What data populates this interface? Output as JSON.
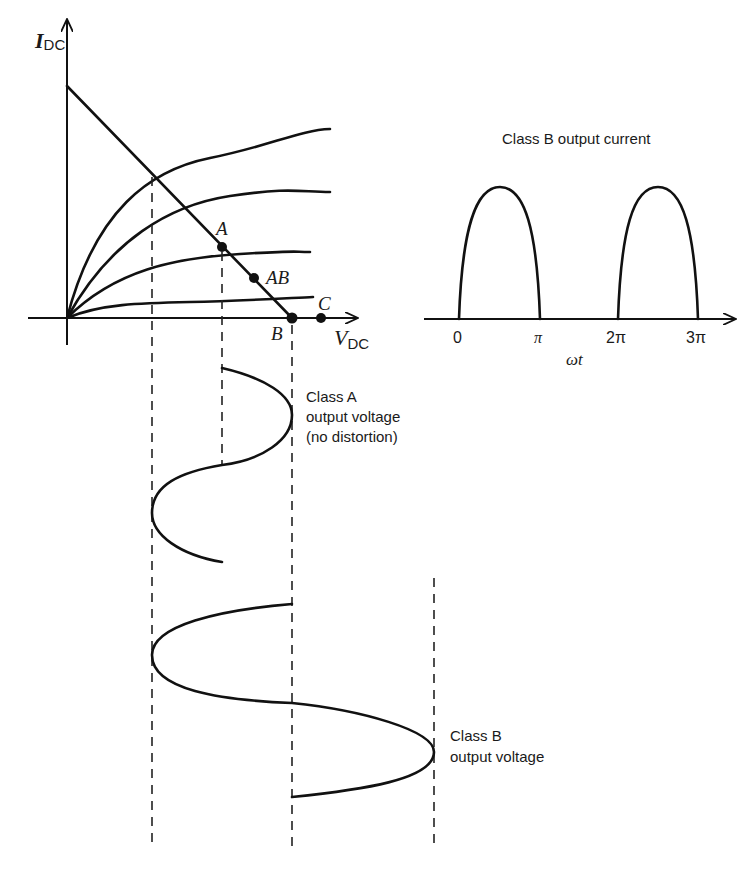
{
  "characteristic_plot": {
    "y_axis_label_main": "I",
    "y_axis_label_sub": "DC",
    "x_axis_label_main": "V",
    "x_axis_label_sub": "DC",
    "operating_points": [
      {
        "label": "A",
        "name": "point-a"
      },
      {
        "label": "AB",
        "name": "point-ab"
      },
      {
        "label": "B",
        "name": "point-b"
      },
      {
        "label": "C",
        "name": "point-c"
      }
    ],
    "curve_count": 4
  },
  "class_b_current": {
    "title": "Class B output current",
    "tick_labels": [
      "0",
      "π",
      "2π",
      "3π"
    ],
    "x_axis_label": "ωt"
  },
  "class_a_voltage": {
    "label_line1": "Class A",
    "label_line2": "output voltage",
    "label_line3": "(no distortion)"
  },
  "class_b_voltage": {
    "label_line1": "Class B",
    "label_line2": "output voltage"
  },
  "colors": {
    "ink": "#111111",
    "background": "#ffffff"
  }
}
